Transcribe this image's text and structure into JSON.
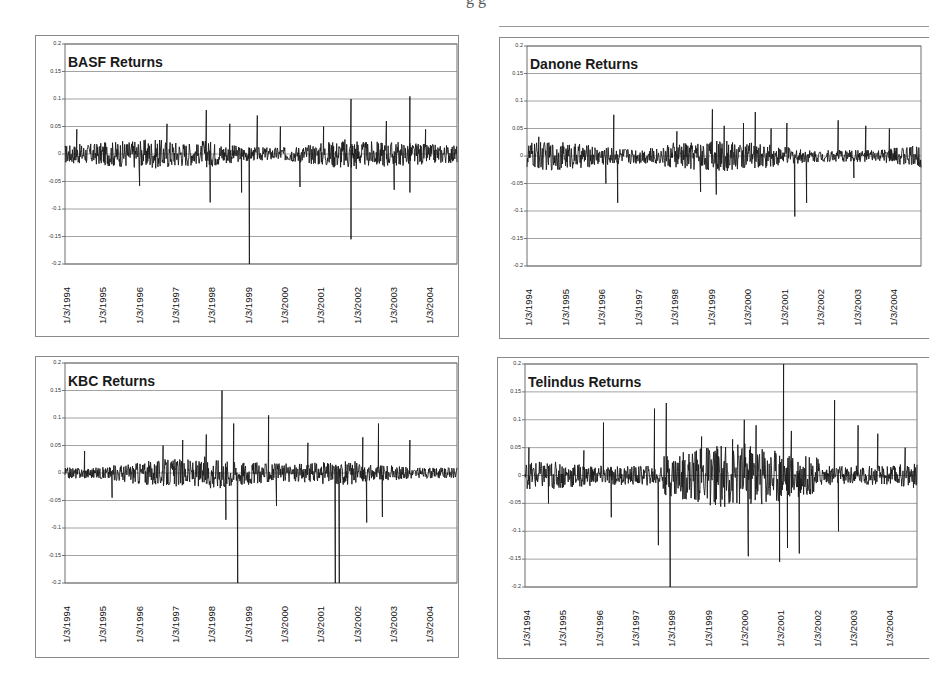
{
  "page": {
    "caption_fragment": "g                 g"
  },
  "chart_data": [
    {
      "type": "line",
      "title": "BASF Returns",
      "xlabel": "",
      "ylabel": "",
      "ylim": [
        -0.2,
        0.2
      ],
      "yticks": [
        "0.2",
        "0.15",
        "0.1",
        "0.05",
        "0",
        "-0.05",
        "-0.1",
        "-0.15",
        "-0.2"
      ],
      "x_tick_labels": [
        "1/3/1994",
        "1/3/1995",
        "1/3/1996",
        "1/3/1997",
        "1/3/1998",
        "1/3/1999",
        "1/3/2000",
        "1/3/2001",
        "1/3/2002",
        "1/3/2003",
        "1/3/2004"
      ],
      "grid": true,
      "legend": "none",
      "noise_band": 0.025,
      "spikes": [
        {
          "t": 0.03,
          "v": 0.045
        },
        {
          "t": 0.19,
          "v": -0.058
        },
        {
          "t": 0.26,
          "v": 0.055
        },
        {
          "t": 0.36,
          "v": 0.08
        },
        {
          "t": 0.37,
          "v": -0.088
        },
        {
          "t": 0.42,
          "v": 0.055
        },
        {
          "t": 0.45,
          "v": -0.07
        },
        {
          "t": 0.47,
          "v": -0.2
        },
        {
          "t": 0.49,
          "v": 0.07
        },
        {
          "t": 0.55,
          "v": 0.05
        },
        {
          "t": 0.6,
          "v": -0.06
        },
        {
          "t": 0.66,
          "v": 0.05
        },
        {
          "t": 0.73,
          "v": 0.1
        },
        {
          "t": 0.73,
          "v": -0.155
        },
        {
          "t": 0.82,
          "v": 0.06
        },
        {
          "t": 0.84,
          "v": -0.065
        },
        {
          "t": 0.88,
          "v": 0.105
        },
        {
          "t": 0.88,
          "v": -0.07
        },
        {
          "t": 0.92,
          "v": 0.045
        }
      ]
    },
    {
      "type": "line",
      "title": "Danone Returns",
      "xlabel": "",
      "ylabel": "",
      "ylim": [
        -0.2,
        0.2
      ],
      "yticks": [
        "0.2",
        "0.15",
        "0.1",
        "0.05",
        "0",
        "-0.05",
        "-0.1",
        "-0.15",
        "-0.2"
      ],
      "x_tick_labels": [
        "1/3/1994",
        "1/3/1995",
        "1/3/1996",
        "1/3/1997",
        "1/3/1998",
        "1/3/1999",
        "1/3/2000",
        "1/3/2001",
        "1/3/2002",
        "1/3/2003",
        "1/3/2004"
      ],
      "grid": true,
      "legend": "none",
      "noise_band": 0.022,
      "spikes": [
        {
          "t": 0.03,
          "v": 0.035
        },
        {
          "t": 0.2,
          "v": -0.05
        },
        {
          "t": 0.22,
          "v": 0.075
        },
        {
          "t": 0.23,
          "v": -0.085
        },
        {
          "t": 0.38,
          "v": 0.045
        },
        {
          "t": 0.44,
          "v": -0.065
        },
        {
          "t": 0.47,
          "v": 0.085
        },
        {
          "t": 0.48,
          "v": -0.07
        },
        {
          "t": 0.5,
          "v": 0.055
        },
        {
          "t": 0.55,
          "v": 0.06
        },
        {
          "t": 0.58,
          "v": 0.08
        },
        {
          "t": 0.62,
          "v": 0.05
        },
        {
          "t": 0.66,
          "v": 0.06
        },
        {
          "t": 0.68,
          "v": -0.11
        },
        {
          "t": 0.71,
          "v": -0.085
        },
        {
          "t": 0.79,
          "v": 0.065
        },
        {
          "t": 0.83,
          "v": -0.04
        },
        {
          "t": 0.86,
          "v": 0.055
        },
        {
          "t": 0.92,
          "v": 0.05
        }
      ]
    },
    {
      "type": "line",
      "title": "KBC Returns",
      "xlabel": "",
      "ylabel": "",
      "ylim": [
        -0.2,
        0.2
      ],
      "yticks": [
        "0.2",
        "0.15",
        "0.1",
        "0.05",
        "0",
        "-0.05",
        "-0.1",
        "-0.15",
        "-0.2"
      ],
      "x_tick_labels": [
        "1/3/1994",
        "1/3/1995",
        "1/3/1996",
        "1/3/1997",
        "1/3/1998",
        "1/3/1999",
        "1/3/2000",
        "1/3/2001",
        "1/3/2002",
        "1/3/2003",
        "1/3/2004"
      ],
      "grid": true,
      "legend": "none",
      "noise_band": 0.02,
      "spikes": [
        {
          "t": 0.05,
          "v": 0.04
        },
        {
          "t": 0.12,
          "v": -0.045
        },
        {
          "t": 0.25,
          "v": 0.05
        },
        {
          "t": 0.3,
          "v": 0.06
        },
        {
          "t": 0.36,
          "v": 0.07
        },
        {
          "t": 0.4,
          "v": 0.15
        },
        {
          "t": 0.41,
          "v": -0.085
        },
        {
          "t": 0.43,
          "v": 0.09
        },
        {
          "t": 0.44,
          "v": -0.2
        },
        {
          "t": 0.52,
          "v": 0.105
        },
        {
          "t": 0.54,
          "v": -0.06
        },
        {
          "t": 0.62,
          "v": 0.055
        },
        {
          "t": 0.69,
          "v": -0.2
        },
        {
          "t": 0.7,
          "v": -0.2
        },
        {
          "t": 0.76,
          "v": 0.065
        },
        {
          "t": 0.77,
          "v": -0.09
        },
        {
          "t": 0.8,
          "v": 0.09
        },
        {
          "t": 0.81,
          "v": -0.08
        },
        {
          "t": 0.88,
          "v": 0.06
        }
      ]
    },
    {
      "type": "line",
      "title": "Telindus Returns",
      "xlabel": "",
      "ylabel": "",
      "ylim": [
        -0.2,
        0.2
      ],
      "yticks": [
        "0.2",
        "0.15",
        "0.1",
        "0.05",
        "0",
        "-0.05",
        "-0.1",
        "-0.15",
        "-0.2"
      ],
      "x_tick_labels": [
        "1/3/1994",
        "1/3/1995",
        "1/3/1996",
        "1/3/1997",
        "1/3/1998",
        "1/3/1999",
        "1/3/2000",
        "1/3/2001",
        "1/3/2002",
        "1/3/2003",
        "1/3/2004"
      ],
      "grid": true,
      "legend": "none",
      "noise_band": 0.035,
      "spikes": [
        {
          "t": 0.01,
          "v": 0.05
        },
        {
          "t": 0.06,
          "v": -0.05
        },
        {
          "t": 0.15,
          "v": 0.045
        },
        {
          "t": 0.2,
          "v": 0.095
        },
        {
          "t": 0.22,
          "v": -0.075
        },
        {
          "t": 0.33,
          "v": 0.12
        },
        {
          "t": 0.34,
          "v": -0.125
        },
        {
          "t": 0.36,
          "v": 0.13
        },
        {
          "t": 0.37,
          "v": -0.2
        },
        {
          "t": 0.45,
          "v": 0.07
        },
        {
          "t": 0.53,
          "v": 0.065
        },
        {
          "t": 0.56,
          "v": 0.1
        },
        {
          "t": 0.57,
          "v": -0.145
        },
        {
          "t": 0.59,
          "v": 0.09
        },
        {
          "t": 0.65,
          "v": -0.155
        },
        {
          "t": 0.66,
          "v": 0.2
        },
        {
          "t": 0.67,
          "v": -0.13
        },
        {
          "t": 0.68,
          "v": 0.08
        },
        {
          "t": 0.7,
          "v": -0.14
        },
        {
          "t": 0.79,
          "v": 0.135
        },
        {
          "t": 0.8,
          "v": -0.1
        },
        {
          "t": 0.85,
          "v": 0.09
        },
        {
          "t": 0.9,
          "v": 0.075
        },
        {
          "t": 0.97,
          "v": 0.05
        }
      ]
    }
  ],
  "layout": {
    "panels": [
      {
        "frame": [
          35,
          35,
          424,
          302
        ],
        "plot": [
          64,
          43,
          392,
          220
        ],
        "open_right": false
      },
      {
        "frame": [
          499,
          37,
          430,
          302
        ],
        "plot": [
          526,
          45,
          394,
          220
        ],
        "open_right": true
      },
      {
        "frame": [
          35,
          356,
          424,
          302
        ],
        "plot": [
          64,
          362,
          392,
          220
        ],
        "open_right": false
      },
      {
        "frame": [
          497,
          357,
          432,
          302
        ],
        "plot": [
          524,
          363,
          392,
          223
        ],
        "open_right": true
      }
    ],
    "line_color": "#1a1a1a",
    "grid_color": "#8c8c8c",
    "frame_color": "#8a8a8a"
  }
}
